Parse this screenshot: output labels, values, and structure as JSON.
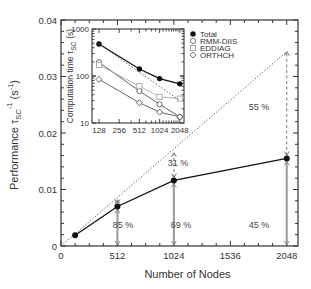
{
  "chart_data": [
    {
      "type": "line",
      "title": "",
      "xlabel": "Number of Nodes",
      "ylabel": "Performance τSC-1 (s-1)",
      "ylabel_parts": {
        "main": "Performance τ",
        "sub": "SC",
        "sup1": "-1",
        "unit": "(s",
        "sup2": "-1",
        "close": ")"
      },
      "xlim": [
        0,
        2150
      ],
      "ylim": [
        0,
        0.04
      ],
      "xticks": [
        0,
        512,
        1024,
        1536,
        2048
      ],
      "xtick_labels": [
        "0",
        "512",
        "1024",
        "1536",
        "2048"
      ],
      "x_minor_step": 128,
      "yticks": [
        0,
        0.01,
        0.02,
        0.03,
        0.04
      ],
      "ytick_labels": [
        "0",
        "0.01",
        "0.02",
        "0.03",
        "0.04"
      ],
      "y_minor_step": 0.002,
      "grid": false,
      "series": [
        {
          "name": "Measured performance",
          "marker": "filled-circle",
          "style": "solid",
          "x": [
            128,
            512,
            1024,
            2048
          ],
          "y": [
            0.0019,
            0.007,
            0.0116,
            0.0155
          ]
        },
        {
          "name": "Ideal scaling",
          "marker": "none",
          "style": "dotted",
          "x": [
            0,
            2048
          ],
          "y": [
            0,
            0.0344
          ]
        }
      ],
      "ideal_at_nodes": [
        {
          "x": 512,
          "y": 0.0082
        },
        {
          "x": 1024,
          "y": 0.0165
        },
        {
          "x": 2048,
          "y": 0.0344
        }
      ],
      "annotations": [
        {
          "text": "85 %",
          "x": 512,
          "kind": "efficiency"
        },
        {
          "text": "69 %",
          "x": 1024,
          "kind": "efficiency"
        },
        {
          "text": "31 %",
          "x": 1024,
          "kind": "loss"
        },
        {
          "text": "45 %",
          "x": 2048,
          "kind": "efficiency"
        },
        {
          "text": "55 %",
          "x": 2048,
          "kind": "loss"
        }
      ]
    },
    {
      "type": "line",
      "title": "",
      "inset": true,
      "xlabel": "",
      "ylabel": "Computation time τSC (s)",
      "ylabel_parts": {
        "main": "Computation time τ",
        "sub": "SC",
        "unit": "(s)"
      },
      "xscale": "log2",
      "yscale": "log10",
      "xticks": [
        128,
        256,
        512,
        1024,
        2048
      ],
      "xtick_labels": [
        "128",
        "256",
        "512",
        "1024",
        "2048"
      ],
      "yticks": [
        10,
        100,
        1000
      ],
      "ytick_labels": [
        "10",
        "100",
        "1000"
      ],
      "ylim": [
        10,
        1000
      ],
      "legend_position": "right-outside-top",
      "series": [
        {
          "name": "Total",
          "marker": "filled-circle",
          "color": "#111111",
          "x": [
            128,
            512,
            1024,
            2048
          ],
          "y": [
            480,
            141,
            88,
            68
          ]
        },
        {
          "name": "RMM-DIIS",
          "marker": "open-circle",
          "color": "#555555",
          "x": [
            128,
            512,
            1024,
            2048
          ],
          "y": [
            195,
            48,
            25,
            13.5
          ]
        },
        {
          "name": "EDDIAG",
          "marker": "open-square",
          "color": "#aaaaaa",
          "x": [
            128,
            512,
            1024,
            2048
          ],
          "y": [
            171,
            61,
            36,
            33
          ]
        },
        {
          "name": "ORTHCH",
          "marker": "open-diamond",
          "color": "#555555",
          "x": [
            128,
            512,
            1024,
            2048
          ],
          "y": [
            85,
            27,
            17,
            13.5
          ]
        },
        {
          "name": "Ideal (Total)",
          "marker": "none",
          "style": "dotted",
          "color": "#555555",
          "x": [
            128,
            2048
          ],
          "y": [
            480,
            30
          ]
        }
      ]
    }
  ]
}
